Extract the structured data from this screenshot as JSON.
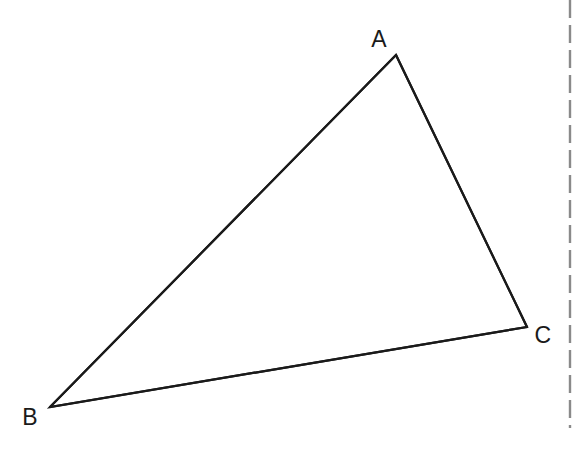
{
  "figure": {
    "kind": "geometry-diagram",
    "canvas": {
      "width": 585,
      "height": 458
    },
    "background_color": "#ffffff",
    "stroke_color": "#1a1a1a",
    "stroke_width": 2.2,
    "vertices": [
      {
        "id": "A",
        "label": "A",
        "x": 396,
        "y": 55,
        "label_x": 379,
        "label_y": 39
      },
      {
        "id": "B",
        "label": "B",
        "x": 50,
        "y": 407,
        "label_x": 30,
        "label_y": 417
      },
      {
        "id": "C",
        "label": "C",
        "x": 527,
        "y": 327,
        "label_x": 543,
        "label_y": 335
      }
    ],
    "edges": [
      {
        "id": "AB",
        "from": "A",
        "to": "B"
      },
      {
        "id": "BC",
        "from": "B",
        "to": "C"
      },
      {
        "id": "CA",
        "from": "C",
        "to": "A"
      }
    ],
    "polygon_points": "396,55 50,407 527,327",
    "dashed_rule": {
      "name": "page-edge-dashed-line",
      "orientation": "vertical",
      "x": 570,
      "y_start": 0,
      "y_end": 428,
      "color": "#8a8a8a",
      "width": 2.4,
      "dash_length": 18,
      "gap_length": 7
    }
  }
}
